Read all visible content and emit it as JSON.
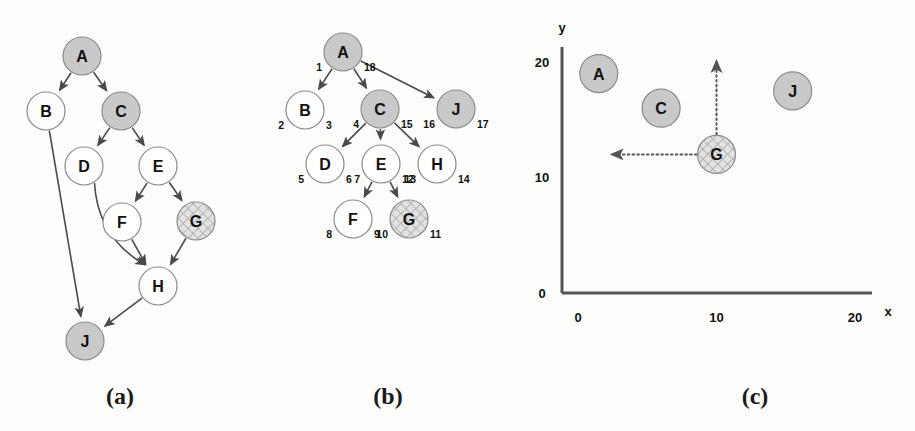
{
  "figure": {
    "background_color": "#fdfdfc",
    "panels": [
      {
        "id": "a",
        "caption": "(a)",
        "caption_x": 120,
        "caption_y": 396
      },
      {
        "id": "b",
        "caption": "(b)",
        "caption_x": 388,
        "caption_y": 396
      },
      {
        "id": "c",
        "caption": "(c)",
        "caption_x": 755,
        "caption_y": 396
      }
    ]
  },
  "style": {
    "node_fill_plain": "#ffffff",
    "node_fill_shaded": "#c9c9c9",
    "node_fill_hatched": "#d8d8d8",
    "node_stroke": "#8a8a8a",
    "edge_color": "#4a4a4a",
    "axis_color": "#555555",
    "text_color": "#111111",
    "node_radius": 19
  },
  "panel_a": {
    "name": "directed-acyclic-graph",
    "nodes": [
      {
        "id": "A",
        "label": "A",
        "x": 82,
        "y": 56,
        "fill": "shaded"
      },
      {
        "id": "B",
        "label": "B",
        "x": 46,
        "y": 111,
        "fill": "plain"
      },
      {
        "id": "C",
        "label": "C",
        "x": 121,
        "y": 111,
        "fill": "shaded"
      },
      {
        "id": "D",
        "label": "D",
        "x": 84,
        "y": 166,
        "fill": "plain"
      },
      {
        "id": "E",
        "label": "E",
        "x": 158,
        "y": 166,
        "fill": "plain"
      },
      {
        "id": "F",
        "label": "F",
        "x": 122,
        "y": 222,
        "fill": "plain"
      },
      {
        "id": "G",
        "label": "G",
        "x": 196,
        "y": 221,
        "fill": "hatched"
      },
      {
        "id": "H",
        "label": "H",
        "x": 158,
        "y": 286,
        "fill": "plain"
      },
      {
        "id": "J",
        "label": "J",
        "x": 85,
        "y": 341,
        "fill": "shaded"
      }
    ],
    "edges": [
      {
        "from": "A",
        "to": "B"
      },
      {
        "from": "A",
        "to": "C"
      },
      {
        "from": "C",
        "to": "D"
      },
      {
        "from": "C",
        "to": "E"
      },
      {
        "from": "E",
        "to": "F"
      },
      {
        "from": "E",
        "to": "G"
      },
      {
        "from": "F",
        "to": "H"
      },
      {
        "from": "G",
        "to": "H"
      },
      {
        "from": "D",
        "to": "H",
        "curved": true
      },
      {
        "from": "B",
        "to": "J"
      },
      {
        "from": "H",
        "to": "J"
      }
    ]
  },
  "panel_b": {
    "name": "dfs-tree-with-discovery-finish-times",
    "nodes": [
      {
        "id": "A",
        "label": "A",
        "x": 343,
        "y": 52,
        "fill": "shaded",
        "pre": "1",
        "post": "18"
      },
      {
        "id": "B",
        "label": "B",
        "x": 305,
        "y": 110,
        "fill": "plain",
        "pre": "2",
        "post": "3"
      },
      {
        "id": "C",
        "label": "C",
        "x": 380,
        "y": 109,
        "fill": "shaded",
        "pre": "4",
        "post": "15"
      },
      {
        "id": "J",
        "label": "J",
        "x": 456,
        "y": 109,
        "fill": "shaded",
        "pre": "16",
        "post": "17"
      },
      {
        "id": "D",
        "label": "D",
        "x": 325,
        "y": 164,
        "fill": "plain",
        "pre": "5",
        "post": "6"
      },
      {
        "id": "E",
        "label": "E",
        "x": 381,
        "y": 164,
        "fill": "plain",
        "pre": "7",
        "post": "12"
      },
      {
        "id": "H",
        "label": "H",
        "x": 437,
        "y": 164,
        "fill": "plain",
        "pre": "13",
        "post": "14"
      },
      {
        "id": "F",
        "label": "F",
        "x": 353,
        "y": 219,
        "fill": "plain",
        "pre": "8",
        "post": "9"
      },
      {
        "id": "G",
        "label": "G",
        "x": 409,
        "y": 219,
        "fill": "hatched",
        "pre": "10",
        "post": "11"
      }
    ],
    "edges": [
      {
        "from": "A",
        "to": "B"
      },
      {
        "from": "A",
        "to": "C"
      },
      {
        "from": "A",
        "to": "J"
      },
      {
        "from": "C",
        "to": "D"
      },
      {
        "from": "C",
        "to": "E"
      },
      {
        "from": "C",
        "to": "H"
      },
      {
        "from": "E",
        "to": "F"
      },
      {
        "from": "E",
        "to": "G"
      }
    ]
  },
  "chart_data": {
    "type": "scatter",
    "title": "",
    "xlabel": "x",
    "ylabel": "y",
    "xlim": [
      0,
      22
    ],
    "ylim": [
      0,
      22
    ],
    "xticks": [
      0,
      10,
      20
    ],
    "xtick_labels": [
      "0",
      "10",
      "20"
    ],
    "yticks": [
      0,
      10,
      20
    ],
    "ytick_labels": [
      "0",
      "10",
      "20"
    ],
    "grid": false,
    "legend": "none",
    "points": [
      {
        "label": "A",
        "x": 1.5,
        "y": 19.0,
        "fill": "shaded"
      },
      {
        "label": "C",
        "x": 6.0,
        "y": 16.0,
        "fill": "shaded"
      },
      {
        "label": "G",
        "x": 10.0,
        "y": 12.0,
        "fill": "hatched"
      },
      {
        "label": "J",
        "x": 15.5,
        "y": 17.5,
        "fill": "shaded"
      }
    ],
    "annotations": [
      {
        "name": "up-arrow-from-G",
        "type": "dotted-arrow",
        "from": [
          10.0,
          12.0
        ],
        "to": [
          10.0,
          20.0
        ]
      },
      {
        "name": "left-arrow-from-G",
        "type": "dotted-arrow",
        "from": [
          10.0,
          12.0
        ],
        "to": [
          2.5,
          12.0
        ]
      }
    ]
  }
}
